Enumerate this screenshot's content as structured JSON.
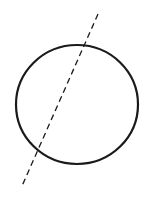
{
  "diagram": {
    "background": "#ffffff",
    "stroke_color": "#1a1a1a",
    "circle": {
      "cx": 77,
      "cy": 104.5,
      "rx": 61,
      "ry": 59.5,
      "stroke_width": 2.2
    },
    "secant_line": {
      "x1": 98,
      "y1": 14,
      "x2": 22,
      "y2": 186,
      "stroke_width": 1.3,
      "dash": "6 4"
    }
  }
}
